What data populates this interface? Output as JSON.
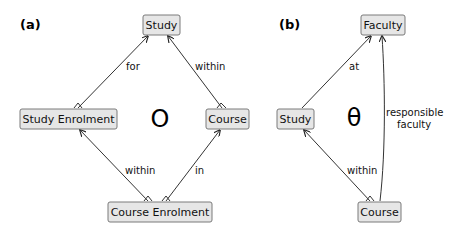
{
  "panels": [
    {
      "label": "(a)",
      "symbol": "O",
      "nodes": {
        "study": "Study",
        "study_enrolment": "Study Enrolment",
        "course": "Course",
        "course_enrolment": "Course Enrolment"
      },
      "edges": {
        "study_enrolment_to_study": "for",
        "course_to_study": "within",
        "course_enrolment_to_study_enrolment": "within",
        "course_enrolment_to_course": "in"
      }
    },
    {
      "label": "(b)",
      "symbol": "θ",
      "nodes": {
        "faculty": "Faculty",
        "study": "Study",
        "course": "Course"
      },
      "edges": {
        "study_to_faculty": "at",
        "course_to_faculty_line1": "responsible",
        "course_to_faculty_line2": "faculty",
        "course_to_study": "within"
      }
    }
  ]
}
